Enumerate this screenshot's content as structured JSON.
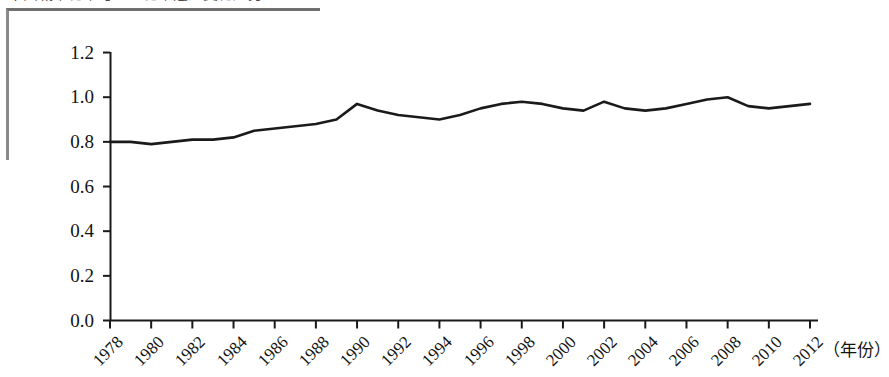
{
  "caption": {
    "text": "中国城市化率与工业化率之比变化趋势",
    "note": "cropped-top-text"
  },
  "chart_data": {
    "type": "line",
    "title": "",
    "xlabel": "（年份）",
    "ylabel": "",
    "ylim": [
      0.0,
      1.2
    ],
    "xlim": [
      1978,
      2012
    ],
    "grid": false,
    "legend": false,
    "y_ticks": [
      "0.0",
      "0.2",
      "0.4",
      "0.6",
      "0.8",
      "1.0",
      "1.2"
    ],
    "y_tick_values": [
      0.0,
      0.2,
      0.4,
      0.6,
      0.8,
      1.0,
      1.2
    ],
    "x_ticks": [
      "1978",
      "1980",
      "1982",
      "1984",
      "1986",
      "1988",
      "1990",
      "1992",
      "1994",
      "1996",
      "1998",
      "2000",
      "2002",
      "2004",
      "2006",
      "2008",
      "2010",
      "2012"
    ],
    "x": [
      1978,
      1979,
      1980,
      1981,
      1982,
      1983,
      1984,
      1985,
      1986,
      1987,
      1988,
      1989,
      1990,
      1991,
      1992,
      1993,
      1994,
      1995,
      1996,
      1997,
      1998,
      1999,
      2000,
      2001,
      2002,
      2003,
      2004,
      2005,
      2006,
      2007,
      2008,
      2009,
      2010,
      2011,
      2012
    ],
    "series": [
      {
        "name": "比值",
        "color": "#1a1a1a",
        "values": [
          0.8,
          0.8,
          0.79,
          0.8,
          0.81,
          0.81,
          0.82,
          0.85,
          0.86,
          0.87,
          0.88,
          0.9,
          0.97,
          0.94,
          0.92,
          0.91,
          0.9,
          0.92,
          0.95,
          0.97,
          0.98,
          0.97,
          0.95,
          0.94,
          0.98,
          0.95,
          0.94,
          0.95,
          0.97,
          0.99,
          1.0,
          0.96,
          0.95,
          0.96,
          0.97
        ]
      }
    ]
  },
  "axis": {
    "x_unit_label": "（年份）"
  }
}
